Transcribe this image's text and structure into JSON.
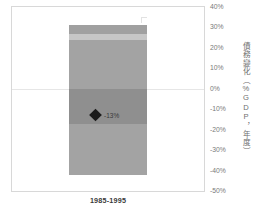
{
  "chart_data": {
    "type": "bar",
    "title": "",
    "subtitle": "",
    "xlabel": "",
    "ylabel": "債務變化（%GDP，年度）",
    "categories": [
      "1985-1995"
    ],
    "ylim": [
      -50,
      40
    ],
    "ytick_labels": [
      "40%",
      "30%",
      "20%",
      "10%",
      "0%",
      "-10%",
      "-20%",
      "-30%",
      "-40%",
      "-50%"
    ],
    "ytick_values": [
      40,
      30,
      20,
      10,
      0,
      -10,
      -20,
      -30,
      -40,
      -50
    ],
    "grid": false,
    "zero_line": true,
    "legend_position": "none",
    "stacked_segments": [
      {
        "name": "segment-top",
        "from": 31,
        "to": 27,
        "color": "#a0a0a0"
      },
      {
        "name": "segment-upper-light",
        "from": 27,
        "to": 24,
        "color": "#c6c6c6"
      },
      {
        "name": "segment-upper-mid",
        "from": 24,
        "to": 0,
        "color": "#a3a3a3"
      },
      {
        "name": "segment-lower-dark",
        "from": 0,
        "to": -17,
        "color": "#8f8f8f"
      },
      {
        "name": "segment-bottom",
        "from": -17,
        "to": -42,
        "color": "#a3a3a3"
      }
    ],
    "annotations": [
      {
        "name": "net-change-marker",
        "value": -13,
        "label": "-13%",
        "marker": "diamond",
        "color": "#1a1a1a"
      }
    ]
  },
  "axis": {
    "y_title": "債務變化（%GDP，年度）",
    "x_category": "1985-1995"
  },
  "colors": {
    "segment_dark": "#8f8f8f",
    "segment_mid": "#a3a3a3",
    "segment_light": "#c6c6c6",
    "segment_top": "#a0a0a0",
    "marker": "#1a1a1a",
    "axis_text": "#7a7a7a",
    "border": "#d8d8d8"
  }
}
